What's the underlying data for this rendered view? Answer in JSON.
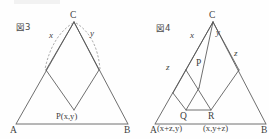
{
  "sheet": {
    "background_color": "#fefefe",
    "line_color": "#555555",
    "dash_color": "#8d8d8d",
    "text_color": "#404040",
    "width": 269,
    "height": 139
  },
  "figures": [
    {
      "id": "figure-3",
      "caption": "図3",
      "vertices": {
        "apex": "C",
        "left_base": "A",
        "right_base": "B",
        "interior_point": "P"
      },
      "labels": {
        "x": "x",
        "y": "y",
        "point_coords": "P(x,y)"
      },
      "arcs": [
        {
          "name": "arc-x",
          "label": "x"
        },
        {
          "name": "arc-y",
          "label": "y"
        }
      ]
    },
    {
      "id": "figure-4",
      "caption": "図4",
      "vertices": {
        "apex": "C",
        "left_base": "A",
        "right_base": "B",
        "interior_point": "P",
        "lower_left_point": "Q",
        "lower_right_point": "R"
      },
      "labels": {
        "x": "x",
        "y": "y",
        "z_left": "z",
        "z_mid_left": "z",
        "z_right": "z",
        "q_coords": "(x+z,y)",
        "r_coords": "(x,y+z)"
      }
    }
  ]
}
